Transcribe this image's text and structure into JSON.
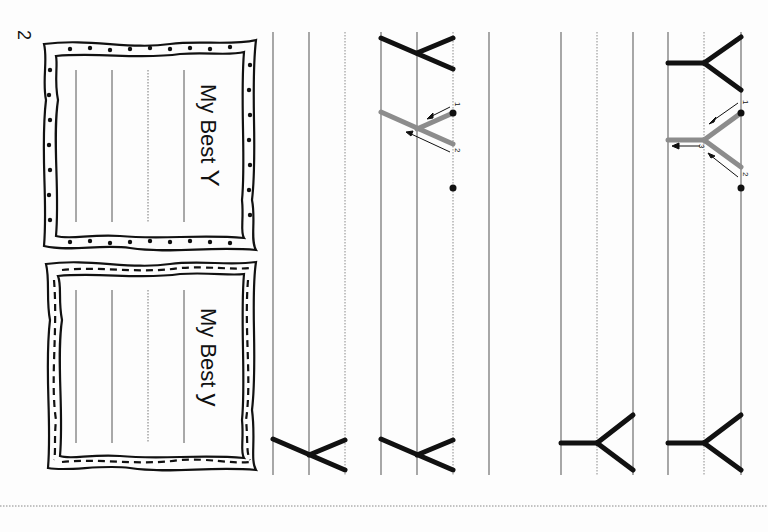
{
  "page": {
    "page_number": "2",
    "orientation": "rotated 90deg clockwise",
    "colors": {
      "ink": "#111111",
      "guide_stroke": "#8a8a8a",
      "rule_line": "#777777",
      "dotted_line": "#9a9a9a"
    }
  },
  "frames": [
    {
      "title": "My Best",
      "letter": "Y",
      "border_style": "dots"
    },
    {
      "title": "My Best",
      "letter": "y",
      "border_style": "dashes"
    }
  ],
  "practice_rows": [
    {
      "letter": "Y",
      "case": "uppercase",
      "model_count": 1,
      "traced_guides": 1,
      "stroke_numbers": [
        "1",
        "2",
        "3"
      ],
      "trailing_models": 1
    },
    {
      "letter": "Y",
      "case": "uppercase",
      "model_count": 0,
      "trailing_models": 1
    },
    {
      "letter": "y",
      "case": "lowercase",
      "model_count": 1,
      "traced_guides": 1,
      "stroke_numbers": [
        "1",
        "2"
      ],
      "trailing_models": 1
    },
    {
      "letter": "y",
      "case": "lowercase",
      "model_count": 0,
      "trailing_models": 1
    }
  ],
  "stroke_labels": {
    "one": "1",
    "two": "2",
    "three": "3"
  }
}
